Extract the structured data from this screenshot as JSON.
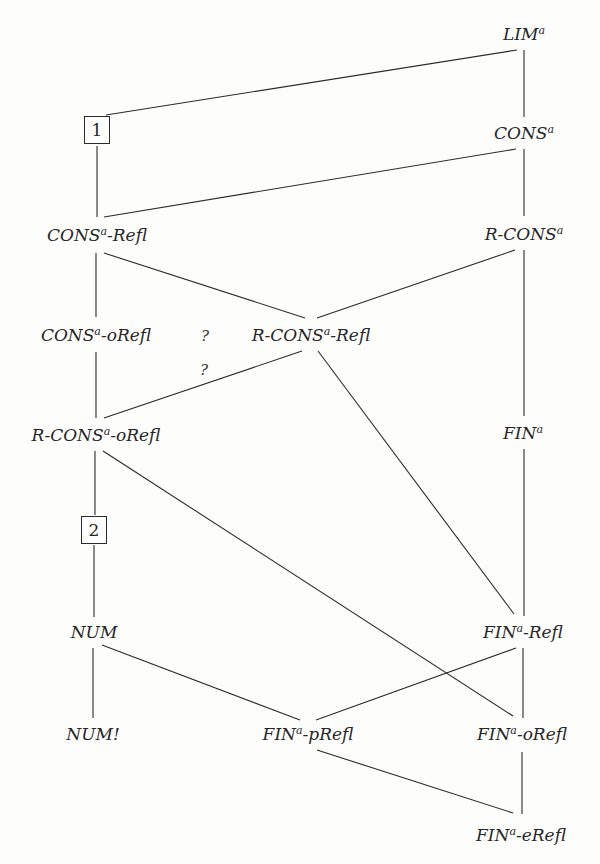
{
  "diagram": {
    "type": "hasse-diagram",
    "nodes": {
      "lim": {
        "base": "LIM",
        "sup": "a",
        "suffix": ""
      },
      "box1": {
        "label": "1"
      },
      "cons": {
        "base": "CONS",
        "sup": "a",
        "suffix": ""
      },
      "cons_refl": {
        "base": "CONS",
        "sup": "a",
        "suffix": "-Refl"
      },
      "r_cons": {
        "base": "R-CONS",
        "sup": "a",
        "suffix": ""
      },
      "cons_orefl": {
        "base": "CONS",
        "sup": "a",
        "suffix": "-oRefl"
      },
      "r_cons_refl": {
        "base": "R-CONS",
        "sup": "a",
        "suffix": "-Refl"
      },
      "r_cons_orefl": {
        "base": "R-CONS",
        "sup": "a",
        "suffix": "-oRefl"
      },
      "fin": {
        "base": "FIN",
        "sup": "a",
        "suffix": ""
      },
      "box2": {
        "label": "2"
      },
      "num": {
        "base": "NUM",
        "sup": "",
        "suffix": ""
      },
      "fin_refl": {
        "base": "FIN",
        "sup": "a",
        "suffix": "-Refl"
      },
      "num_bang": {
        "base": "NUM!",
        "sup": "",
        "suffix": ""
      },
      "fin_prefl": {
        "base": "FIN",
        "sup": "a",
        "suffix": "-pRefl"
      },
      "fin_orefl": {
        "base": "FIN",
        "sup": "a",
        "suffix": "-oRefl"
      },
      "fin_erefl": {
        "base": "FIN",
        "sup": "a",
        "suffix": "-eRefl"
      }
    },
    "question_marks": [
      "?",
      "?"
    ],
    "edges": [
      [
        "LIM^a",
        "1"
      ],
      [
        "LIM^a",
        "CONS^a"
      ],
      [
        "1",
        "CONS^a-Refl"
      ],
      [
        "CONS^a",
        "CONS^a-Refl"
      ],
      [
        "CONS^a",
        "R-CONS^a"
      ],
      [
        "CONS^a-Refl",
        "CONS^a-oRefl"
      ],
      [
        "CONS^a-Refl",
        "R-CONS^a-Refl"
      ],
      [
        "R-CONS^a",
        "R-CONS^a-Refl"
      ],
      [
        "R-CONS^a",
        "FIN^a"
      ],
      [
        "CONS^a-oRefl",
        "R-CONS^a-oRefl"
      ],
      [
        "R-CONS^a-Refl",
        "R-CONS^a-oRefl"
      ],
      [
        "R-CONS^a-Refl",
        "FIN^a-Refl"
      ],
      [
        "R-CONS^a-oRefl",
        "2"
      ],
      [
        "R-CONS^a-oRefl",
        "FIN^a-oRefl"
      ],
      [
        "2",
        "NUM"
      ],
      [
        "FIN^a",
        "FIN^a-Refl"
      ],
      [
        "NUM",
        "NUM!"
      ],
      [
        "NUM",
        "FIN^a-pRefl"
      ],
      [
        "FIN^a-Refl",
        "FIN^a-pRefl"
      ],
      [
        "FIN^a-Refl",
        "FIN^a-oRefl"
      ],
      [
        "FIN^a-pRefl",
        "FIN^a-eRefl"
      ],
      [
        "FIN^a-oRefl",
        "FIN^a-eRefl"
      ]
    ]
  }
}
